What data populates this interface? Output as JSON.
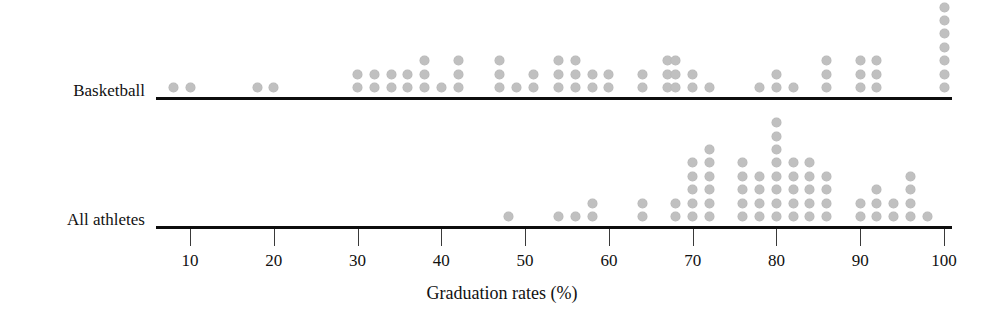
{
  "chart_data": {
    "type": "scatter",
    "subtype": "dot-plot",
    "title": "",
    "xlabel": "Graduation rates (%)",
    "ylabel": "",
    "xlim": [
      5,
      103
    ],
    "ylim": [
      0,
      2
    ],
    "grid": false,
    "legend": null,
    "tick_labels": [
      "10",
      "20",
      "30",
      "40",
      "50",
      "60",
      "70",
      "80",
      "90",
      "100"
    ],
    "ticks": [
      10,
      20,
      30,
      40,
      50,
      60,
      70,
      80,
      90,
      100
    ],
    "dot_color": "#c0c0c0",
    "axis_color": "#0d0d0d",
    "series": [
      {
        "name": "Basketball",
        "label": "Basketball",
        "stacks": [
          {
            "x": 8,
            "count": 1
          },
          {
            "x": 10,
            "count": 1
          },
          {
            "x": 18,
            "count": 1
          },
          {
            "x": 20,
            "count": 1
          },
          {
            "x": 30,
            "count": 2
          },
          {
            "x": 32,
            "count": 2
          },
          {
            "x": 34,
            "count": 2
          },
          {
            "x": 36,
            "count": 2
          },
          {
            "x": 38,
            "count": 3
          },
          {
            "x": 40,
            "count": 1
          },
          {
            "x": 42,
            "count": 3
          },
          {
            "x": 47,
            "count": 3
          },
          {
            "x": 49,
            "count": 1
          },
          {
            "x": 51,
            "count": 2
          },
          {
            "x": 54,
            "count": 3
          },
          {
            "x": 56,
            "count": 3
          },
          {
            "x": 58,
            "count": 2
          },
          {
            "x": 60,
            "count": 2
          },
          {
            "x": 64,
            "count": 2
          },
          {
            "x": 67,
            "count": 3
          },
          {
            "x": 68,
            "count": 3
          },
          {
            "x": 70,
            "count": 2
          },
          {
            "x": 72,
            "count": 1
          },
          {
            "x": 78,
            "count": 1
          },
          {
            "x": 80,
            "count": 2
          },
          {
            "x": 82,
            "count": 1
          },
          {
            "x": 86,
            "count": 3
          },
          {
            "x": 90,
            "count": 3
          },
          {
            "x": 92,
            "count": 3
          },
          {
            "x": 100,
            "count": 7
          }
        ],
        "total": 67
      },
      {
        "name": "All athletes",
        "label": "All athletes",
        "stacks": [
          {
            "x": 48,
            "count": 1
          },
          {
            "x": 54,
            "count": 1
          },
          {
            "x": 56,
            "count": 1
          },
          {
            "x": 58,
            "count": 2
          },
          {
            "x": 64,
            "count": 2
          },
          {
            "x": 68,
            "count": 2
          },
          {
            "x": 70,
            "count": 5
          },
          {
            "x": 72,
            "count": 6
          },
          {
            "x": 76,
            "count": 5
          },
          {
            "x": 78,
            "count": 4
          },
          {
            "x": 80,
            "count": 8
          },
          {
            "x": 82,
            "count": 5
          },
          {
            "x": 84,
            "count": 5
          },
          {
            "x": 86,
            "count": 4
          },
          {
            "x": 90,
            "count": 2
          },
          {
            "x": 92,
            "count": 3
          },
          {
            "x": 94,
            "count": 2
          },
          {
            "x": 96,
            "count": 4
          },
          {
            "x": 98,
            "count": 1
          }
        ],
        "total": 63
      }
    ]
  }
}
